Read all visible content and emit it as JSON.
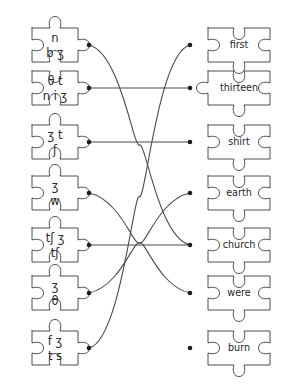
{
  "worksheet": {
    "title": "Phonetic transcription matching puzzle",
    "background_color": "#ffffff",
    "line_color": "#4a4a4a",
    "outline_color": "#3a3a3a",
    "text_color": "#2a2a2a",
    "dot_color": "#1c1c1c"
  },
  "left_column": {
    "label": "IPA transcription puzzle pieces",
    "pieces": [
      {
        "id": "ipa-piece-1",
        "transcription": "nbɜ",
        "line_top": "n",
        "line_bottom": "b ʒ",
        "dot_y": 45
      },
      {
        "id": "ipa-piece-2",
        "transcription": "θtniʒ",
        "line_top": "θ t",
        "line_bottom": "n i ʒ",
        "dot_y": 88
      },
      {
        "id": "ipa-piece-3",
        "transcription": "ʒtʃ",
        "line_top": "ʒ t",
        "line_bottom": "ʃ",
        "dot_y": 142
      },
      {
        "id": "ipa-piece-4",
        "transcription": "wʒ",
        "line_top": "ʒ",
        "line_bottom": "w",
        "dot_y": 193
      },
      {
        "id": "ipa-piece-5",
        "transcription": "tʃʒtʃ",
        "line_top": "tʃ ʒ",
        "line_bottom": "tʃ",
        "dot_y": 245
      },
      {
        "id": "ipa-piece-6",
        "transcription": "θʒ",
        "line_top": "ʒ",
        "line_bottom": "θ",
        "dot_y": 293
      },
      {
        "id": "ipa-piece-7",
        "transcription": "fʒts",
        "line_top": "f ʒ",
        "line_bottom": "t s",
        "dot_y": 348
      }
    ]
  },
  "right_column": {
    "label": "English word puzzle pieces",
    "pieces": [
      {
        "id": "word-piece-1",
        "word": "first",
        "dot_y": 45
      },
      {
        "id": "word-piece-2",
        "word": "thirteen",
        "dot_y": 88
      },
      {
        "id": "word-piece-3",
        "word": "shirt",
        "dot_y": 142
      },
      {
        "id": "word-piece-4",
        "word": "earth",
        "dot_y": 193
      },
      {
        "id": "word-piece-5",
        "word": "church",
        "dot_y": 245
      },
      {
        "id": "word-piece-6",
        "word": "were",
        "dot_y": 293
      },
      {
        "id": "word-piece-7",
        "word": "burn",
        "dot_y": 348
      }
    ]
  },
  "connections": [
    {
      "id": "connection-1",
      "from_index": 0,
      "to_index": 4,
      "from_word": "nbɜ",
      "to_word": "church"
    },
    {
      "id": "connection-2",
      "from_index": 1,
      "to_index": 1,
      "from_word": "θtniʒ",
      "to_word": "thirteen"
    },
    {
      "id": "connection-3",
      "from_index": 2,
      "to_index": 2,
      "from_word": "ʒtʃ",
      "to_word": "shirt"
    },
    {
      "id": "connection-4",
      "from_index": 3,
      "to_index": 5,
      "from_word": "wʒ",
      "to_word": "were"
    },
    {
      "id": "connection-5",
      "from_index": 4,
      "to_index": 4,
      "from_word": "tʃʒtʃ",
      "to_word": "church"
    },
    {
      "id": "connection-6",
      "from_index": 5,
      "to_index": 3,
      "from_word": "θʒ",
      "to_word": "earth"
    },
    {
      "id": "connection-7",
      "from_index": 6,
      "to_index": 0,
      "from_word": "fʒts",
      "to_word": "first"
    }
  ]
}
